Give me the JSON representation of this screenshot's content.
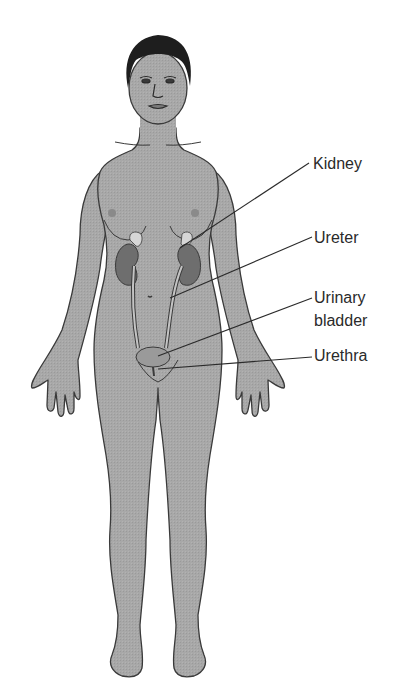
{
  "figure": {
    "colors": {
      "skin": "#a6a6a6",
      "outline": "#3a3a3a",
      "hair": "#1e1e1e",
      "kidney": "#6e6e6e",
      "adrenal": "#d6d6d6",
      "ureter": "#c4c4c4",
      "bladder": "#9a9a9a",
      "leader": "#2a2a2a",
      "background": "#ffffff"
    }
  },
  "labels": [
    {
      "id": "kidney",
      "text": "Kidney",
      "x": 313,
      "y": 154,
      "line": [
        180,
        248,
        309,
        163
      ]
    },
    {
      "id": "ureter",
      "text": "Ureter",
      "x": 314,
      "y": 228,
      "line": [
        170,
        298,
        312,
        237
      ]
    },
    {
      "id": "urinary-bladder",
      "text": "Urinary\nbladder",
      "line1": "Urinary",
      "line2": "bladder",
      "x": 314,
      "y": 288,
      "line": [
        158,
        356,
        312,
        298
      ]
    },
    {
      "id": "urethra",
      "text": "Urethra",
      "x": 314,
      "y": 346,
      "line": [
        168,
        369,
        312,
        357
      ]
    }
  ]
}
